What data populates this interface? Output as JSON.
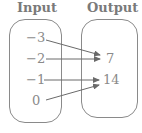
{
  "headers": {
    "input": "Input",
    "output": "Output"
  },
  "inputs": [
    "−3",
    "−2",
    "−1",
    "0"
  ],
  "outputs": [
    "7",
    "14"
  ],
  "mapping": [
    {
      "from": "-3",
      "to": "7"
    },
    {
      "from": "-2",
      "to": "7"
    },
    {
      "from": "-1",
      "to": "14"
    },
    {
      "from": "0",
      "to": "14"
    }
  ]
}
